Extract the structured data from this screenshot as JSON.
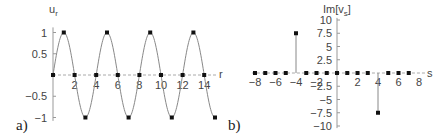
{
  "chart_data": [
    {
      "panel_label": "a)",
      "type": "line",
      "title": "",
      "xlabel": "r",
      "ylabel": "u_r",
      "xlim": [
        0,
        15
      ],
      "ylim": [
        -1,
        1
      ],
      "xticks": [
        "2",
        "4",
        "6",
        "8",
        "10",
        "12",
        "14"
      ],
      "yticks": [
        "1",
        "0.5",
        "-0.5",
        "-1"
      ],
      "curve": "sin(pi*r/2)",
      "series": [
        {
          "name": "u_r curve",
          "x": [
            0,
            1,
            2,
            3,
            4,
            5,
            6,
            7,
            8,
            9,
            10,
            11,
            12,
            13,
            14,
            15
          ],
          "values": [
            0,
            1,
            0,
            -1,
            0,
            1,
            0,
            -1,
            0,
            1,
            0,
            -1,
            0,
            1,
            0,
            -1
          ]
        }
      ],
      "markers_x": [
        0,
        1,
        2,
        3,
        4,
        5,
        6,
        7,
        8,
        9,
        10,
        11,
        12,
        13,
        14,
        15
      ],
      "grid": false,
      "legend": null
    },
    {
      "panel_label": "b)",
      "type": "scatter",
      "title": "",
      "xlabel": "s",
      "ylabel": "Im[v_s]",
      "xlim": [
        -8,
        8
      ],
      "ylim": [
        -10,
        10
      ],
      "xticks": [
        "-8",
        "-6",
        "-4",
        "-2",
        "2",
        "4",
        "6",
        "8"
      ],
      "yticks": [
        "10",
        "7.5",
        "5",
        "2.5",
        "-2.5",
        "-5",
        "-7.5",
        "-10"
      ],
      "series": [
        {
          "name": "Im[v_s]",
          "x": [
            -8,
            -7,
            -6,
            -5,
            -4,
            -3,
            -2,
            -1,
            0,
            1,
            2,
            3,
            4,
            5,
            6,
            7
          ],
          "values": [
            0,
            0,
            0,
            0,
            7.5,
            0,
            0,
            0,
            0,
            0,
            0,
            0,
            -7.5,
            0,
            0,
            0
          ]
        }
      ],
      "stems": [
        {
          "x": -4,
          "y": 7.5
        },
        {
          "x": 4,
          "y": -7.5
        }
      ],
      "grid": false,
      "legend": null
    }
  ],
  "labels": {
    "panel_a": "a)",
    "panel_b": "b)",
    "a_ylabel_main": "u",
    "a_ylabel_sub": "r",
    "a_xlabel": "r",
    "b_ylabel_main": "Im[v",
    "b_ylabel_sub": "s",
    "b_ylabel_end": "]",
    "b_xlabel": "s"
  }
}
